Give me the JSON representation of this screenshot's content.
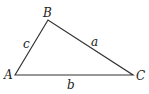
{
  "diagram": {
    "type": "triangle",
    "vertices": [
      {
        "name": "A",
        "x": 15,
        "y": 75,
        "label_x": 4,
        "label_y": 79
      },
      {
        "name": "B",
        "x": 48,
        "y": 20,
        "label_x": 43,
        "label_y": 17
      },
      {
        "name": "C",
        "x": 133,
        "y": 75,
        "label_x": 136,
        "label_y": 80
      }
    ],
    "sides": [
      {
        "name": "a",
        "from": "B",
        "to": "C",
        "label_x": 91,
        "label_y": 46
      },
      {
        "name": "b",
        "from": "A",
        "to": "C",
        "label_x": 67,
        "label_y": 89
      },
      {
        "name": "c",
        "from": "A",
        "to": "B",
        "label_x": 23,
        "label_y": 48
      }
    ],
    "stroke_color": "#333333"
  }
}
